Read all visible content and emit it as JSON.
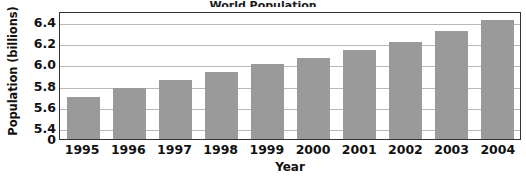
{
  "chart_data": {
    "type": "bar",
    "title": "World Population",
    "title_truncated": true,
    "xlabel": "Year",
    "ylabel": "Population (billions)",
    "categories": [
      "1995",
      "1996",
      "1997",
      "1998",
      "1999",
      "2000",
      "2001",
      "2002",
      "2003",
      "2004"
    ],
    "values": [
      5.69,
      5.78,
      5.85,
      5.93,
      6.0,
      6.06,
      6.13,
      6.21,
      6.31,
      6.42
    ],
    "ylim": [
      5.3,
      6.5
    ],
    "yticks": [
      "0",
      "5.4",
      "5.6",
      "5.8",
      "6.0",
      "6.2",
      "6.4"
    ],
    "ytick_values": [
      0,
      5.4,
      5.6,
      5.8,
      6.0,
      6.2,
      6.4
    ],
    "axis_break": true,
    "grid": "horizontal",
    "legend": "none",
    "bar_color": "#9a9a9a",
    "grid_color": "#b9b9b9",
    "axis_color": "#333333",
    "text_color": "#111111",
    "background": "#ffffff"
  }
}
